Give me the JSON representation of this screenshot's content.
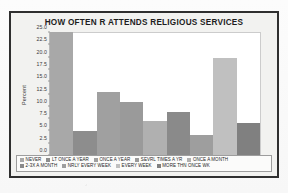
{
  "chart_data": {
    "type": "bar",
    "title": "HOW OFTEN R ATTENDS RELIGIOUS SERVICES",
    "xlabel": "",
    "ylabel": "Percent",
    "ylim": [
      0.0,
      25.0
    ],
    "yticks": [
      "0.0",
      "2.5",
      "5.0",
      "7.5",
      "10.0",
      "12.5",
      "15.0",
      "17.5",
      "20.0",
      "22.5",
      "25.0"
    ],
    "grid": false,
    "legend_position": "bottom",
    "categories": [
      "NEVER",
      "LT ONCE A YEAR",
      "ONCE A YEAR",
      "SEVRL TIMES A YR",
      "ONCE A MONTH",
      "2-3X A MONTH",
      "NRLY EVERY WEEK",
      "EVERY WEEK",
      "MORE THN ONCE WK"
    ],
    "values": [
      25.2,
      5.0,
      13.0,
      11.0,
      7.2,
      9.0,
      4.3,
      19.9,
      6.7
    ],
    "colors": [
      "#a8a8a8",
      "#8d8d8d",
      "#a0a0a0",
      "#9a9a9a",
      "#b0b0b0",
      "#8a8a8a",
      "#9e9e9e",
      "#c0c0c0",
      "#808080"
    ]
  },
  "legend": {
    "row1": [
      {
        "label": "NEVER",
        "color": "#a8a8a8"
      },
      {
        "label": "LT ONCE A YEAR",
        "color": "#8d8d8d"
      },
      {
        "label": "ONCE A YEAR",
        "color": "#a0a0a0"
      },
      {
        "label": "SEVRL TIMES A YR",
        "color": "#9a9a9a"
      },
      {
        "label": "ONCE A MONTH",
        "color": "#b0b0b0"
      }
    ],
    "row2": [
      {
        "label": "2-3X A MONTH",
        "color": "#8a8a8a"
      },
      {
        "label": "NRLY EVERY WEEK",
        "color": "#9e9e9e"
      },
      {
        "label": "EVERY WEEK",
        "color": "#c0c0c0"
      },
      {
        "label": "MORE THN ONCE WK",
        "color": "#808080"
      }
    ]
  }
}
